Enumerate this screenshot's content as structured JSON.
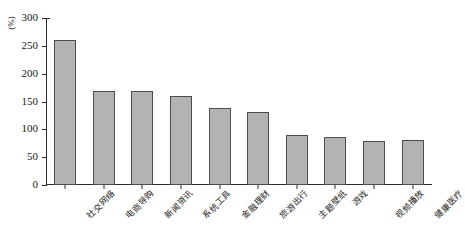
{
  "chart_data": {
    "type": "bar",
    "title": "",
    "subtitle": "",
    "xlabel": "",
    "ylabel": "",
    "yunit": "(%)",
    "ylim": [
      0,
      300
    ],
    "yticks": [
      0,
      50,
      100,
      150,
      200,
      250,
      300
    ],
    "ytick_labels": [
      "0",
      "50",
      "100",
      "150",
      "200",
      "250",
      "300"
    ],
    "grid": false,
    "legend": null,
    "categories": [
      "社交网络",
      "电商导购",
      "新闻资讯",
      "系统工具",
      "金融理财",
      "旅游出行",
      "主题壁纸",
      "游戏",
      "视频播放",
      "健康医疗"
    ],
    "values": [
      260,
      168,
      168,
      160,
      138,
      132,
      90,
      87,
      79,
      81
    ],
    "bar_color": "#b3b3b3",
    "bar_edge_color": "#4d4d4d",
    "axis_color": "#2b2b2b"
  },
  "caption": {
    "text": ""
  }
}
